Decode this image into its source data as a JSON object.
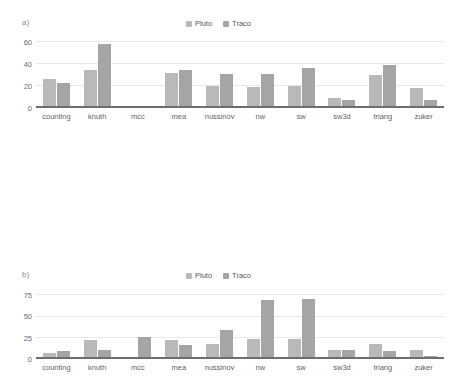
{
  "figure": {
    "background": "#ffffff",
    "series_colors": {
      "Pluto": "#b9b9b9",
      "Traco": "#a5a5a5"
    },
    "panels": [
      {
        "tag": "a)"
      },
      {
        "tag": "b)"
      },
      {
        "tag": "c)"
      }
    ]
  },
  "legend": {
    "entries": [
      {
        "label": "Pluto",
        "color": "#b9b9b9"
      },
      {
        "label": "Traco",
        "color": "#a5a5a5"
      }
    ]
  },
  "chart_data": [
    {
      "type": "bar",
      "panel": "a)",
      "title": "",
      "xlabel": "",
      "ylabel": "",
      "ylim": [
        0,
        65
      ],
      "yticks": [
        0,
        20,
        40,
        60
      ],
      "grid": true,
      "legend_position": "top-center",
      "categories": [
        "counting",
        "knuth",
        "mcc",
        "mea",
        "nussinov",
        "nw",
        "sw",
        "sw3d",
        "triang",
        "zuker"
      ],
      "series": [
        {
          "name": "Pluto",
          "values": [
            26,
            34,
            1,
            32,
            20,
            19,
            20,
            9,
            29.5,
            18.5
          ]
        },
        {
          "name": "Traco",
          "values": [
            23,
            58,
            1.5,
            34.5,
            31,
            30.5,
            36,
            7,
            39,
            7
          ]
        }
      ]
    },
    {
      "type": "bar",
      "panel": "b)",
      "title": "",
      "xlabel": "",
      "ylabel": "",
      "ylim": [
        0,
        82
      ],
      "yticks": [
        0,
        25,
        50,
        75
      ],
      "grid": true,
      "legend_position": "top-center",
      "categories": [
        "counting",
        "knuth",
        "mcc",
        "mea",
        "nussinov",
        "nw",
        "sw",
        "sw3d",
        "triang",
        "zuker"
      ],
      "series": [
        {
          "name": "Pluto",
          "values": [
            7,
            22,
            2.5,
            22,
            17.5,
            23,
            23.5,
            11,
            18,
            11
          ]
        },
        {
          "name": "Traco",
          "values": [
            9,
            10.5,
            26,
            16,
            34,
            69,
            70,
            10,
            9.5,
            4
          ]
        }
      ]
    },
    {
      "type": "bar",
      "panel": "c)",
      "title": "",
      "xlabel": "",
      "ylabel": "",
      "ylim": [
        0,
        21
      ],
      "yticks": [
        0,
        5,
        10,
        15,
        20
      ],
      "grid": true,
      "legend_position": "top-center",
      "categories": [
        "counting",
        "knuth",
        "mcc",
        "mea",
        "nussinov",
        "nw",
        "sw",
        "sw3d",
        "triang",
        "zuker"
      ],
      "series": [
        {
          "name": "Pluto",
          "values": [
            4,
            5,
            2.2,
            4.8,
            2,
            4.8,
            4.4,
            2,
            3.9,
            4.4
          ]
        },
        {
          "name": "Traco",
          "values": [
            7,
            9.5,
            5,
            4.9,
            10.8,
            16.4,
            15,
            1.8,
            6.7,
            6.4
          ]
        }
      ]
    }
  ]
}
